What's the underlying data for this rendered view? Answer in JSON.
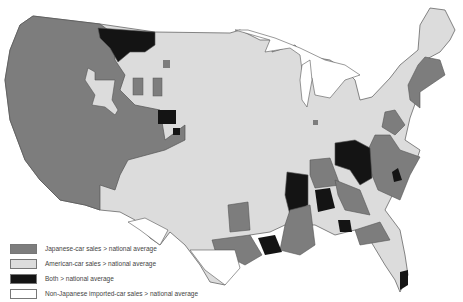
{
  "map": {
    "subject": "United States car sales by region",
    "colors": {
      "japanese": "#7d7d7d",
      "american": "#dcdcdc",
      "both": "#141414",
      "non_japanese_import": "#ffffff",
      "border": "#555555"
    }
  },
  "legend": {
    "items": [
      {
        "key": "japanese",
        "label": "Japanese-car sales > national average",
        "color": "#7d7d7d"
      },
      {
        "key": "american",
        "label": "American-car sales > national average",
        "color": "#dcdcdc"
      },
      {
        "key": "both",
        "label": "Both > national average",
        "color": "#141414"
      },
      {
        "key": "non_japanese_import",
        "label": "Non-Japanese imported-car sales > national average",
        "color": "#ffffff"
      }
    ]
  }
}
